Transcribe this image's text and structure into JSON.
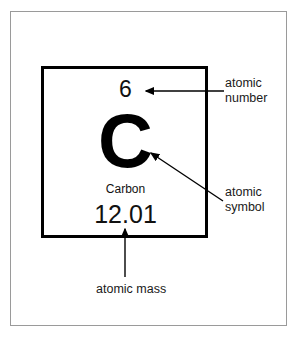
{
  "diagram": {
    "element": {
      "atomic_number": "6",
      "symbol": "C",
      "name": "Carbon",
      "atomic_mass": "12.01"
    },
    "annotations": [
      {
        "id": "atomic-number",
        "label": "atomic\nnumber",
        "points_to": "atomic_number",
        "arrow": "left"
      },
      {
        "id": "atomic-symbol",
        "label": "atomic\nsymbol",
        "points_to": "symbol",
        "arrow": "up-left"
      },
      {
        "id": "atomic-mass",
        "label": "atomic mass",
        "points_to": "atomic_mass",
        "arrow": "up"
      }
    ],
    "colors": {
      "ink": "#000000",
      "text": "#1a1a1a",
      "frame": "#9a9a9a",
      "background": "#ffffff"
    }
  }
}
